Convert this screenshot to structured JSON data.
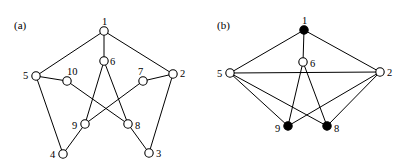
{
  "figure": {
    "background_color": "#ffffff",
    "stroke_color": "#000000",
    "fill_color_solid": "#000000",
    "fill_color_hollow": "#ffffff",
    "width": 410,
    "height": 167
  },
  "panels": [
    {
      "id": "a",
      "caption": "(a)",
      "caption_x": 14,
      "caption_y": 20,
      "nodes": [
        {
          "label": "1",
          "x": 104,
          "y": 31,
          "r": 4.2,
          "filled": false,
          "label_dx": -2,
          "label_dy": -14
        },
        {
          "label": "2",
          "x": 173,
          "y": 74,
          "r": 4.2,
          "filled": false,
          "label_dx": 7,
          "label_dy": -5
        },
        {
          "label": "3",
          "x": 149,
          "y": 153,
          "r": 4.2,
          "filled": false,
          "label_dx": 7,
          "label_dy": -4
        },
        {
          "label": "4",
          "x": 63,
          "y": 154,
          "r": 4.2,
          "filled": false,
          "label_dx": -13,
          "label_dy": -4
        },
        {
          "label": "5",
          "x": 36,
          "y": 76,
          "r": 4.2,
          "filled": false,
          "label_dx": -13,
          "label_dy": -5
        },
        {
          "label": "6",
          "x": 104,
          "y": 61,
          "r": 4.2,
          "filled": false,
          "label_dx": 6,
          "label_dy": -4
        },
        {
          "label": "7",
          "x": 143,
          "y": 81,
          "r": 4.2,
          "filled": false,
          "label_dx": -5,
          "label_dy": -14
        },
        {
          "label": "8",
          "x": 128,
          "y": 124,
          "r": 4.2,
          "filled": false,
          "label_dx": 7,
          "label_dy": -3
        },
        {
          "label": "9",
          "x": 85,
          "y": 124,
          "r": 4.2,
          "filled": false,
          "label_dx": -13,
          "label_dy": -3
        },
        {
          "label": "10",
          "x": 67,
          "y": 81,
          "r": 4.2,
          "filled": false,
          "label_dx": 0,
          "label_dy": -14
        }
      ],
      "edges": [
        {
          "from": "1",
          "to": "5"
        },
        {
          "from": "1",
          "to": "2"
        },
        {
          "from": "1",
          "to": "6"
        },
        {
          "from": "2",
          "to": "3"
        },
        {
          "from": "2",
          "to": "7"
        },
        {
          "from": "3",
          "to": "8"
        },
        {
          "from": "4",
          "to": "5"
        },
        {
          "from": "4",
          "to": "9"
        },
        {
          "from": "5",
          "to": "10"
        },
        {
          "from": "6",
          "to": "9"
        },
        {
          "from": "6",
          "to": "8"
        },
        {
          "from": "7",
          "to": "9"
        },
        {
          "from": "10",
          "to": "8"
        }
      ]
    },
    {
      "id": "b",
      "caption": "(b)",
      "caption_x": 12,
      "caption_y": 20,
      "nodes": [
        {
          "label": "1",
          "x": 99,
          "y": 30,
          "r": 4.2,
          "filled": true,
          "label_dx": -2,
          "label_dy": -14
        },
        {
          "label": "2",
          "x": 175,
          "y": 72,
          "r": 4.2,
          "filled": false,
          "label_dx": 7,
          "label_dy": -4
        },
        {
          "label": "5",
          "x": 25,
          "y": 73,
          "r": 4.2,
          "filled": false,
          "label_dx": -13,
          "label_dy": -4
        },
        {
          "label": "6",
          "x": 98,
          "y": 62,
          "r": 4.2,
          "filled": false,
          "label_dx": 7,
          "label_dy": -3
        },
        {
          "label": "8",
          "x": 122,
          "y": 126,
          "r": 4.2,
          "filled": true,
          "label_dx": 7,
          "label_dy": -2
        },
        {
          "label": "9",
          "x": 83,
          "y": 126,
          "r": 4.2,
          "filled": true,
          "label_dx": -13,
          "label_dy": -2
        }
      ],
      "edges": [
        {
          "from": "1",
          "to": "5"
        },
        {
          "from": "1",
          "to": "2"
        },
        {
          "from": "1",
          "to": "6"
        },
        {
          "from": "5",
          "to": "2"
        },
        {
          "from": "5",
          "to": "9"
        },
        {
          "from": "5",
          "to": "8"
        },
        {
          "from": "2",
          "to": "9"
        },
        {
          "from": "2",
          "to": "8"
        },
        {
          "from": "6",
          "to": "9"
        },
        {
          "from": "6",
          "to": "8"
        }
      ]
    }
  ]
}
